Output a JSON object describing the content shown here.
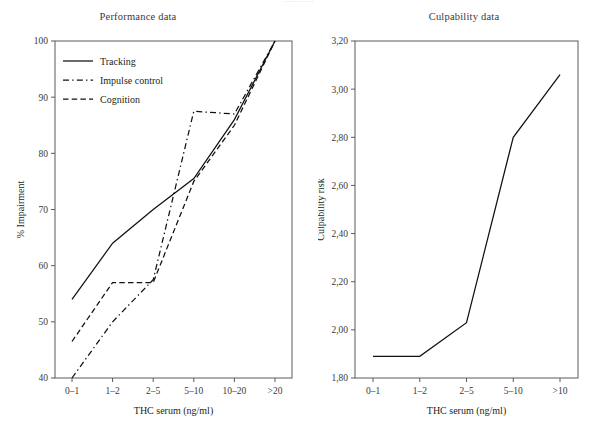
{
  "cut_header_text": "............",
  "left": {
    "title": "Performance data",
    "xlabel": "THC serum (ng/ml)",
    "ylabel": "% Impairment",
    "ticks_y": [
      "40",
      "50",
      "60",
      "70",
      "80",
      "90",
      "100"
    ],
    "ticks_x": [
      "0–1",
      "1–2",
      "2–5",
      "5–10",
      "10–20",
      ">20"
    ],
    "legend": [
      {
        "label": "Tracking",
        "style": "solid"
      },
      {
        "label": "Impulse control",
        "style": "dash-dot"
      },
      {
        "label": "Cognition",
        "style": "dashed"
      }
    ]
  },
  "right": {
    "title": "Culpability data",
    "xlabel": "THC serum (ng/ml)",
    "ylabel": "Culpability risk",
    "ticks_y": [
      "1,80",
      "2,00",
      "2,20",
      "2,40",
      "2,60",
      "2,80",
      "3,00",
      "3,20"
    ],
    "ticks_x": [
      "0–1",
      "1–2",
      "2–5",
      "5–10",
      ">10"
    ]
  },
  "colors": {
    "ink": "#111111",
    "axis": "#5a5a5a",
    "text": "#231f20",
    "background": "#ffffff"
  },
  "chart_data": [
    {
      "type": "line",
      "title": "Performance data",
      "xlabel": "THC serum (ng/ml)",
      "ylabel": "% Impairment",
      "categories": [
        "0–1",
        "1–2",
        "2–5",
        "5–10",
        "10–20",
        ">20"
      ],
      "ylim": [
        40,
        100
      ],
      "yticks": [
        40,
        50,
        60,
        70,
        80,
        90,
        100
      ],
      "grid": false,
      "legend": "top-left",
      "series": [
        {
          "name": "Tracking",
          "style": "solid",
          "values": [
            54,
            64,
            70,
            75.5,
            86,
            100
          ]
        },
        {
          "name": "Impulse control",
          "style": "dash-dot",
          "values": [
            40,
            50,
            57.5,
            87.5,
            87,
            100
          ]
        },
        {
          "name": "Cognition",
          "style": "dashed",
          "values": [
            46.5,
            57,
            57,
            75,
            85,
            100
          ]
        }
      ]
    },
    {
      "type": "line",
      "title": "Culpability data",
      "xlabel": "THC serum (ng/ml)",
      "ylabel": "Culpability risk",
      "categories": [
        "0–1",
        "1–2",
        "2–5",
        "5–10",
        ">10"
      ],
      "ylim": [
        1.8,
        3.2
      ],
      "yticks": [
        1.8,
        2.0,
        2.2,
        2.4,
        2.6,
        2.8,
        3.0,
        3.2
      ],
      "grid": false,
      "legend": "none",
      "series": [
        {
          "name": "Culpability risk",
          "style": "solid",
          "values": [
            1.89,
            1.89,
            2.03,
            2.8,
            3.06
          ]
        }
      ]
    }
  ]
}
